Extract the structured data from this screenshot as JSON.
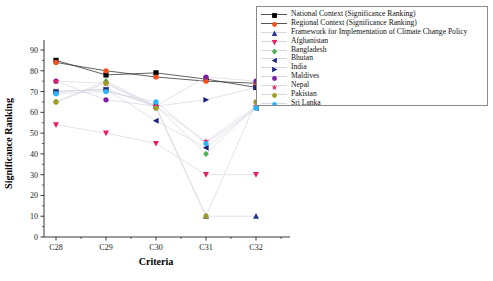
{
  "chart_data": {
    "type": "line",
    "title": "",
    "xlabel": "Criteria",
    "ylabel": "Significance Ranking",
    "categories": [
      "C28",
      "C29",
      "C30",
      "C31",
      "C32"
    ],
    "ylim": [
      0,
      90
    ],
    "yticks": [
      0,
      10,
      20,
      30,
      40,
      50,
      60,
      70,
      80,
      90
    ],
    "grid": false,
    "legend_position": "top-right (outside plot)",
    "series": [
      {
        "name": "National Context (Significance Ranking)",
        "color": "#000000",
        "marker": "square",
        "values": [
          85,
          78,
          79,
          76,
          72
        ]
      },
      {
        "name": "Regional Context (Significance Ranking)",
        "color": "#F4511E",
        "marker": "circle",
        "values": [
          84,
          80,
          77,
          75,
          74
        ]
      },
      {
        "name": "Framework for Implementation of Climate Change Policy",
        "color": "#283593",
        "marker": "triangle-up",
        "values": [
          70,
          71,
          63,
          10,
          10
        ]
      },
      {
        "name": "Afghanistan",
        "color": "#E91E63",
        "marker": "triangle-down",
        "values": [
          54,
          50,
          45,
          30,
          30
        ]
      },
      {
        "name": "Bangladesh",
        "color": "#4CAF50",
        "marker": "diamond",
        "values": [
          65,
          75,
          63,
          40,
          63
        ]
      },
      {
        "name": "Bhutan",
        "color": "#1A237E",
        "marker": "triangle-left",
        "values": [
          70,
          71,
          56,
          43,
          62
        ]
      },
      {
        "name": "India",
        "color": "#1A237E",
        "marker": "triangle-right",
        "values": [
          70,
          71,
          63,
          66,
          72
        ]
      },
      {
        "name": "Maldives",
        "color": "#7B1FA2",
        "marker": "circle",
        "values": [
          75,
          66,
          63,
          77,
          75
        ]
      },
      {
        "name": "Nepal",
        "color": "#E91E63",
        "marker": "star",
        "values": [
          75,
          74,
          63,
          46,
          63
        ]
      },
      {
        "name": "Pakistan",
        "color": "#9E9D24",
        "marker": "circle",
        "values": [
          65,
          74,
          62,
          10,
          65
        ]
      },
      {
        "name": "Sri Lanka",
        "color": "#29B6F6",
        "marker": "circle",
        "values": [
          69,
          70,
          65,
          45,
          62
        ]
      }
    ]
  },
  "axes": {
    "y_title": "Significance Ranking",
    "x_title": "Criteria",
    "y_tick_labels": [
      "0",
      "10",
      "20",
      "30",
      "40",
      "50",
      "60",
      "70",
      "80",
      "90"
    ],
    "x_tick_labels": [
      "C28",
      "C29",
      "C30",
      "C31",
      "C32"
    ]
  },
  "legend": {
    "items": [
      {
        "label": "National Context (Significance Ranking)",
        "color": "#000000",
        "marker": "square"
      },
      {
        "label": "Regional Context (Significance Ranking)",
        "color": "#F4511E",
        "marker": "circle"
      },
      {
        "label": "Framework for Implementation of Climate Change Policy",
        "color": "#283593",
        "marker": "triangle-up"
      },
      {
        "label": "Afghanistan",
        "color": "#E91E63",
        "marker": "triangle-down"
      },
      {
        "label": "Bangladesh",
        "color": "#4CAF50",
        "marker": "diamond"
      },
      {
        "label": "Bhutan",
        "color": "#1A237E",
        "marker": "triangle-left"
      },
      {
        "label": "India",
        "color": "#1A237E",
        "marker": "triangle-right"
      },
      {
        "label": "Maldives",
        "color": "#7B1FA2",
        "marker": "circle"
      },
      {
        "label": "Nepal",
        "color": "#E91E63",
        "marker": "star"
      },
      {
        "label": "Pakistan",
        "color": "#9E9D24",
        "marker": "circle"
      },
      {
        "label": "Sri Lanka",
        "color": "#29B6F6",
        "marker": "circle"
      }
    ]
  }
}
